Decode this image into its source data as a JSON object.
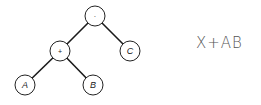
{
  "tree": {
    "nodes": [
      {
        "id": "root",
        "label": "·",
        "kind": "operator",
        "x": 95,
        "y": 16
      },
      {
        "id": "plus",
        "label": "+",
        "kind": "operator",
        "x": 60,
        "y": 51
      },
      {
        "id": "c",
        "label": "C",
        "kind": "leaf",
        "x": 130,
        "y": 51
      },
      {
        "id": "a",
        "label": "A",
        "kind": "leaf",
        "x": 25,
        "y": 85
      },
      {
        "id": "b",
        "label": "B",
        "kind": "leaf",
        "x": 93,
        "y": 85
      }
    ],
    "edges": [
      [
        "root",
        "plus"
      ],
      [
        "root",
        "c"
      ],
      [
        "plus",
        "a"
      ],
      [
        "plus",
        "b"
      ]
    ]
  },
  "expression": "X+AB"
}
